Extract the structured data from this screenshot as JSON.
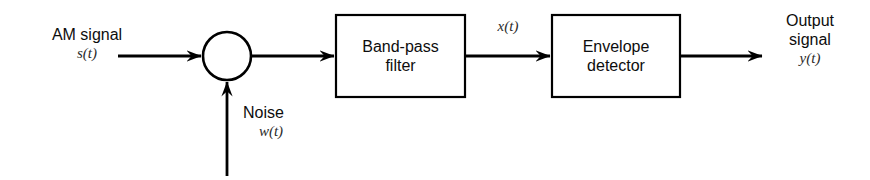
{
  "diagram": {
    "type": "block-diagram",
    "canvas": {
      "width": 870,
      "height": 180
    },
    "style": {
      "background": "#ffffff",
      "stroke": "#000000",
      "text": "#0d0d0d",
      "math_text": "#2b2b2b",
      "stroke_width": 2.6,
      "box_stroke_width": 2.2
    },
    "inputs": {
      "am_signal": {
        "label_line1": "AM signal",
        "symbol": "s(t)",
        "enters": "summing-junction"
      },
      "noise": {
        "label_line1": "Noise",
        "symbol": "w(t)",
        "enters": "summing-junction"
      }
    },
    "nodes": [
      {
        "id": "summing-junction",
        "kind": "circle",
        "label": "",
        "cx": 227,
        "cy": 56,
        "r": 24
      },
      {
        "id": "band-pass-filter",
        "kind": "box",
        "lines": [
          "Band-pass",
          "filter"
        ],
        "x": 336,
        "y": 15,
        "width": 129,
        "height": 82
      },
      {
        "id": "envelope-detector",
        "kind": "box",
        "lines": [
          "Envelope",
          "detector"
        ],
        "x": 552,
        "y": 15,
        "width": 128,
        "height": 82
      }
    ],
    "signals": {
      "filter_output": "x(t)",
      "output_line1": "Output",
      "output_line2": "signal",
      "output_symbol": "y(t)"
    },
    "connections": [
      {
        "from": "am-signal-source",
        "to": "summing-junction",
        "orientation": "horizontal"
      },
      {
        "from": "noise-source",
        "to": "summing-junction",
        "orientation": "vertical-up"
      },
      {
        "from": "summing-junction",
        "to": "band-pass-filter",
        "orientation": "horizontal"
      },
      {
        "from": "band-pass-filter",
        "to": "envelope-detector",
        "orientation": "horizontal",
        "label": "x(t)"
      },
      {
        "from": "envelope-detector",
        "to": "output-signal",
        "orientation": "horizontal",
        "label": "y(t)"
      }
    ]
  }
}
